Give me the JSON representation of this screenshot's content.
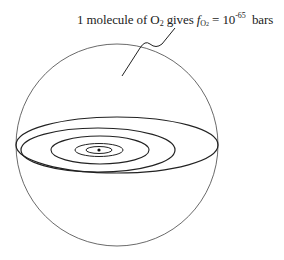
{
  "caption": {
    "prefix": "1 molecule of O",
    "o2_sub": "2",
    "mid": " gives ",
    "f_symbol": "f",
    "f_sub": "O",
    "f_sub2": "2",
    "equals": " = 10",
    "exponent": "-65",
    "unit": "  bars"
  },
  "figure": {
    "sphere": {
      "cx": 117,
      "cy": 145,
      "r": 101
    },
    "ellipses": [
      {
        "cx": 117,
        "cy": 145,
        "rx": 101,
        "ry": 28
      },
      {
        "cx": 98,
        "cy": 150,
        "rx": 77,
        "ry": 22
      },
      {
        "cx": 100,
        "cy": 150,
        "rx": 49,
        "ry": 14
      },
      {
        "cx": 99,
        "cy": 150,
        "rx": 24,
        "ry": 6.5
      },
      {
        "cx": 99,
        "cy": 150,
        "rx": 13,
        "ry": 3.5
      }
    ],
    "center_dot": {
      "cx": 99,
      "cy": 150
    },
    "stroke_color": "#333333"
  }
}
